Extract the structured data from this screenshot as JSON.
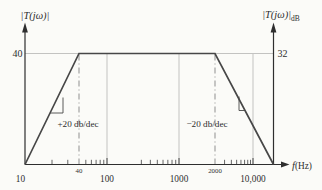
{
  "figure": {
    "background": "#fbfbf8",
    "curve_color": "#474747",
    "axis_color": "#2e2e2e",
    "grid_color": "#c3c3c1",
    "guide_color": "#8f8f8f"
  },
  "chart_data": {
    "type": "line",
    "subtype": "bode-magnitude-bandpass",
    "x_scale": "log",
    "xlabel_italic": "f",
    "xlabel_unit": "(Hz)",
    "left_axis_label": "|T(jω)|",
    "right_axis_label_main": "|T(jω)|",
    "right_axis_label_sub": "dB",
    "left_axis_tick": {
      "value": 40,
      "label": "40"
    },
    "right_axis_tick": {
      "value": 32,
      "label": "32"
    },
    "x_major_ticks": [
      {
        "value": 10,
        "label": "10"
      },
      {
        "value": 100,
        "label": "100"
      },
      {
        "value": 1000,
        "label": "1000"
      },
      {
        "value": 10000,
        "label": "10,000"
      }
    ],
    "x_corner_ticks": [
      {
        "value": 40,
        "label": "40"
      },
      {
        "value": 2000,
        "label": "2000"
      }
    ],
    "x_minor_ticks": [
      20,
      30,
      50,
      60,
      70,
      80,
      90,
      300,
      400,
      500,
      600,
      700,
      800,
      900,
      3000,
      4000,
      5000,
      6000,
      7000,
      8000,
      9000
    ],
    "response": {
      "start_hz": 10,
      "corner_low_hz": 40,
      "corner_high_hz": 2000,
      "passband_gain": 40,
      "passband_gain_db": 32,
      "rise_slope_label": "+20 db/dec",
      "fall_slope_label": "−20 db/dec"
    },
    "grid": {
      "horizontal_at_gain": 40,
      "vertical_at": [
        100,
        1000,
        10000
      ],
      "dash_dot_at": [
        40,
        2000
      ]
    }
  }
}
